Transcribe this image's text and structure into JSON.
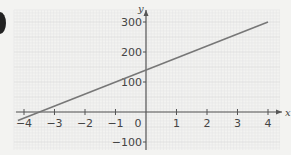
{
  "chart_data": {
    "type": "line",
    "title": "",
    "xlabel": "x",
    "ylabel": "y",
    "xlim": [
      -4.3,
      4.5
    ],
    "ylim": [
      -120,
      340
    ],
    "grid": true,
    "x_ticks": [
      -4,
      -3,
      -2,
      -1,
      0,
      1,
      2,
      3,
      4
    ],
    "x_tick_labels": [
      "-4",
      "-3",
      "-2",
      "-1",
      "0",
      "1",
      "2",
      "3",
      "4"
    ],
    "y_ticks": [
      300,
      200,
      100,
      -100
    ],
    "y_tick_labels": [
      "300",
      "200",
      "100",
      "-100"
    ],
    "series": [
      {
        "name": "line",
        "equation": "y = 40x + 140",
        "x": [
          -4.2,
          -3.5,
          0,
          4
        ],
        "y": [
          -28,
          0,
          140,
          300
        ],
        "color": "#777777"
      }
    ]
  },
  "colors": {
    "background": "#f3f3f1",
    "grid_minor": "#e6e6e6",
    "grid_major": "#d6d6d6",
    "axis": "#555555",
    "line": "#777777"
  }
}
